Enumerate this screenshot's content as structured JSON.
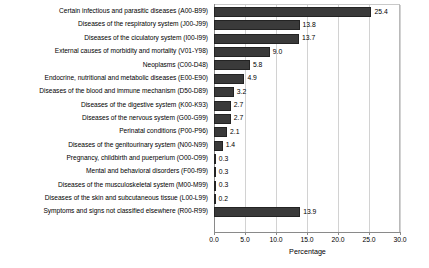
{
  "chart_data": {
    "type": "bar",
    "orientation": "horizontal",
    "title": "",
    "xlabel": "Percentage",
    "ylabel": "",
    "xlim": [
      0.0,
      30.0
    ],
    "xticks": [
      "0.0",
      "5.0",
      "10.0",
      "15.0",
      "20.0",
      "25.0",
      "30.0"
    ],
    "xtick_values": [
      0,
      5,
      10,
      15,
      20,
      25,
      30
    ],
    "grid": "vertical",
    "legend": "none",
    "bar_color": "#3a3a3a",
    "categories": [
      "Certain infectious and parasitic diseases (A00-B99)",
      "Diseases of the respiratory system (J00-J99)",
      "Diseases of the ciculatory system (I00-I99)",
      "External causes of morbidity and mortality (V01-Y98)",
      "Neoplasms (C00-D48)",
      "Endocrine, nutritional and metabolic diseases (E00-E90)",
      "Diseases of the blood and immune mechanism (D50-D89)",
      "Diseases of the digestive system (K00-K93)",
      "Diseases of the nervous system (G00-G99)",
      "Perinatal conditions (P00-P96)",
      "Diseases of the genitourinary system (N00-N99)",
      "Pregnancy, childbirth and puerperium (O00-O99)",
      "Mental and behavioral disorders (F00-f99)",
      "Diseases of the musculoskeletal system (M00-M99)",
      "Diseases of the skin and subcutaneous tissue (L00-L99)",
      "Symptoms and signs not classified elsewhere (R00-R99)"
    ],
    "values": [
      25.4,
      13.8,
      13.7,
      9.0,
      5.8,
      4.9,
      3.2,
      2.7,
      2.7,
      2.1,
      1.4,
      0.3,
      0.3,
      0.3,
      0.2,
      13.9
    ],
    "value_labels": [
      "25.4",
      "13.8",
      "13.7",
      "9.0",
      "5.8",
      "4.9",
      "3.2",
      "2.7",
      "2.7",
      "2.1",
      "1.4",
      "0.3",
      "0.3",
      "0.3",
      "0.2",
      "13.9"
    ]
  }
}
